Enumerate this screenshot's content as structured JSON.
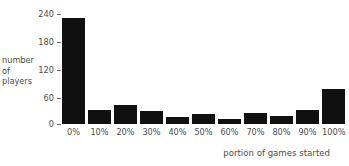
{
  "chart_data": {
    "type": "bar",
    "title": "",
    "subtitle": "",
    "xlabel": "portion of games started",
    "ylabel": "number of players",
    "ylabel_lines": [
      "number",
      "of",
      "players"
    ],
    "categories": [
      "0%",
      "10%",
      "20%",
      "30%",
      "40%",
      "50%",
      "60%",
      "70%",
      "80%",
      "90%",
      "100%"
    ],
    "values": [
      228,
      30,
      41,
      28,
      14,
      21,
      10,
      23,
      17,
      29,
      75
    ],
    "yticks": [
      0,
      60,
      120,
      180,
      240
    ],
    "ytick_labels": [
      "0",
      "60",
      "120",
      "180",
      "240"
    ],
    "ylim": [
      0,
      240
    ],
    "grid": false,
    "legend": null,
    "bar_color": "#101010",
    "text_color": "#4d4d4d",
    "background": "#ffffff",
    "annotations": []
  }
}
